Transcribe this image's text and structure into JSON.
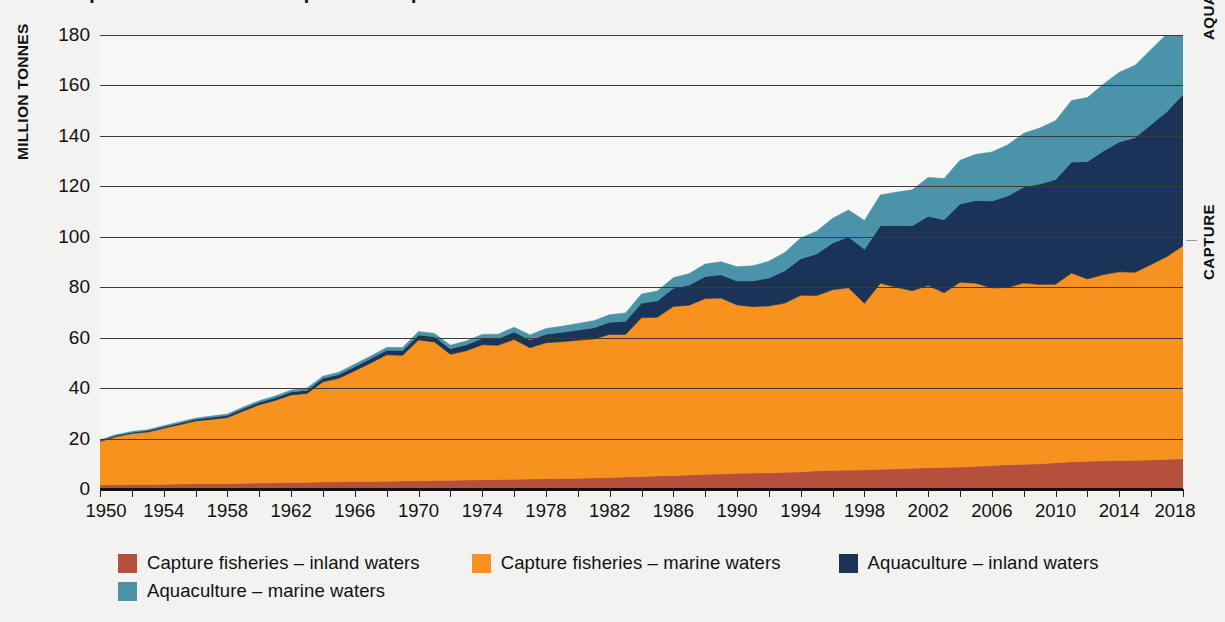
{
  "title": "World capture fisheries and aquaculture production",
  "axes": {
    "y_title": "MILLION TONNES",
    "y_ticks": [
      0,
      20,
      40,
      60,
      80,
      100,
      120,
      140,
      160,
      180
    ],
    "y_min": 0,
    "y_max": 180,
    "x_labels": [
      1950,
      1954,
      1958,
      1962,
      1966,
      1970,
      1974,
      1978,
      1982,
      1986,
      1990,
      1994,
      1998,
      2002,
      2006,
      2010,
      2014,
      2018
    ],
    "x_min": 1950,
    "x_max": 2018,
    "x_tick_step": 2
  },
  "side_labels": {
    "upper": "AQUACULTURE",
    "lower": "CAPTURE"
  },
  "colors": {
    "capture_inland": "#b4503c",
    "capture_marine": "#f7921e",
    "aquaculture_inland": "#1b3356",
    "aquaculture_marine": "#4b93a8",
    "gridline": "#3b3b3b",
    "axis": "#111111",
    "background": "#f2f2f0",
    "plot_background": "#f7f7f5"
  },
  "legend": {
    "rows": [
      [
        {
          "label": "Capture fisheries – inland waters",
          "color_key": "capture_inland",
          "icon": "legend-swatch-icon"
        },
        {
          "label": "Capture fisheries – marine waters",
          "color_key": "capture_marine",
          "icon": "legend-swatch-icon"
        },
        {
          "label": "Aquaculture – inland waters",
          "color_key": "aquaculture_inland",
          "icon": "legend-swatch-icon"
        }
      ],
      [
        {
          "label": "Aquaculture – marine waters",
          "color_key": "aquaculture_marine",
          "icon": "legend-swatch-icon"
        }
      ]
    ]
  },
  "chart_data": {
    "type": "area",
    "stacked": true,
    "title": "World capture fisheries and aquaculture production",
    "xlabel": "",
    "ylabel": "MILLION TONNES",
    "ylim": [
      0,
      180
    ],
    "xlim": [
      1950,
      2018
    ],
    "grid": true,
    "legend_position": "bottom",
    "x": [
      1950,
      1951,
      1952,
      1953,
      1954,
      1955,
      1956,
      1957,
      1958,
      1959,
      1960,
      1961,
      1962,
      1963,
      1964,
      1965,
      1966,
      1967,
      1968,
      1969,
      1970,
      1971,
      1972,
      1973,
      1974,
      1975,
      1976,
      1977,
      1978,
      1979,
      1980,
      1981,
      1982,
      1983,
      1984,
      1985,
      1986,
      1987,
      1988,
      1989,
      1990,
      1991,
      1992,
      1993,
      1994,
      1995,
      1996,
      1997,
      1998,
      1999,
      2000,
      2001,
      2002,
      2003,
      2004,
      2005,
      2006,
      2007,
      2008,
      2009,
      2010,
      2011,
      2012,
      2013,
      2014,
      2015,
      2016,
      2017,
      2018
    ],
    "series": [
      {
        "name": "Capture fisheries – inland waters",
        "color": "#b4503c",
        "values": [
          1.6,
          1.7,
          1.8,
          1.8,
          1.9,
          2.0,
          2.1,
          2.1,
          2.2,
          2.3,
          2.4,
          2.5,
          2.6,
          2.7,
          2.8,
          2.9,
          3.0,
          3.0,
          3.1,
          3.2,
          3.3,
          3.4,
          3.5,
          3.6,
          3.7,
          3.8,
          3.9,
          4.0,
          4.1,
          4.2,
          4.3,
          4.4,
          4.6,
          4.8,
          5.0,
          5.2,
          5.4,
          5.6,
          5.8,
          6.0,
          6.2,
          6.3,
          6.4,
          6.6,
          6.8,
          7.2,
          7.4,
          7.5,
          7.6,
          7.8,
          8.0,
          8.2,
          8.4,
          8.6,
          8.7,
          9.0,
          9.3,
          9.6,
          9.8,
          10.0,
          10.4,
          10.8,
          11.0,
          11.2,
          11.3,
          11.4,
          11.5,
          11.8,
          12.0
        ]
      },
      {
        "name": "Capture fisheries – marine waters",
        "color": "#f7921e",
        "values": [
          17.2,
          19.0,
          20.2,
          20.8,
          22.2,
          23.5,
          24.9,
          25.5,
          26.1,
          28.6,
          31.0,
          32.6,
          34.7,
          35.2,
          39.7,
          41.0,
          43.9,
          47.0,
          50.1,
          49.8,
          55.8,
          54.9,
          49.9,
          51.2,
          53.5,
          53.2,
          55.4,
          52.0,
          53.9,
          54.2,
          54.7,
          55.1,
          56.7,
          56.5,
          62.9,
          62.9,
          67.0,
          67.3,
          69.7,
          69.7,
          66.8,
          66.0,
          66.2,
          67.1,
          70.0,
          69.5,
          71.6,
          72.3,
          66.0,
          73.8,
          72.0,
          70.4,
          72.3,
          69.2,
          73.3,
          72.6,
          70.4,
          70.3,
          71.9,
          71.1,
          70.8,
          74.8,
          72.3,
          73.8,
          74.8,
          74.5,
          77.5,
          80.4,
          84.4
        ]
      },
      {
        "name": "Aquaculture – inland waters",
        "color": "#1b3356",
        "values": [
          0.4,
          0.5,
          0.5,
          0.6,
          0.6,
          0.7,
          0.7,
          0.8,
          0.9,
          1.0,
          1.0,
          1.1,
          1.2,
          1.3,
          1.4,
          1.5,
          1.6,
          1.7,
          1.8,
          1.9,
          2.0,
          2.1,
          2.2,
          2.4,
          2.5,
          2.7,
          2.9,
          3.1,
          3.4,
          3.7,
          4.0,
          4.4,
          4.8,
          5.2,
          5.8,
          6.5,
          7.2,
          8.0,
          8.8,
          9.2,
          9.5,
          10.2,
          11.1,
          12.8,
          14.5,
          16.5,
          18.5,
          20.2,
          21.5,
          22.8,
          24.5,
          25.8,
          27.4,
          29.0,
          31.0,
          32.8,
          34.5,
          36.3,
          38.0,
          39.8,
          41.5,
          44.0,
          46.5,
          49.0,
          51.5,
          53.5,
          55.5,
          57.5,
          60.0
        ]
      },
      {
        "name": "Aquaculture – marine waters",
        "color": "#4b93a8",
        "values": [
          0.2,
          0.3,
          0.3,
          0.3,
          0.4,
          0.4,
          0.4,
          0.5,
          0.5,
          0.6,
          0.6,
          0.7,
          0.7,
          0.8,
          0.8,
          0.9,
          1.0,
          1.0,
          1.1,
          1.2,
          1.3,
          1.3,
          1.4,
          1.5,
          1.6,
          1.7,
          1.9,
          2.0,
          2.2,
          2.4,
          2.6,
          2.8,
          3.0,
          3.3,
          3.6,
          3.9,
          4.2,
          4.5,
          4.9,
          5.2,
          5.6,
          6.0,
          6.6,
          7.3,
          8.2,
          9.0,
          9.8,
          10.6,
          11.4,
          12.2,
          13.2,
          14.2,
          15.4,
          16.3,
          17.3,
          18.3,
          19.4,
          20.3,
          21.3,
          22.2,
          23.3,
          24.4,
          25.4,
          26.5,
          27.6,
          28.6,
          29.8,
          30.8,
          32.4
        ]
      }
    ]
  }
}
